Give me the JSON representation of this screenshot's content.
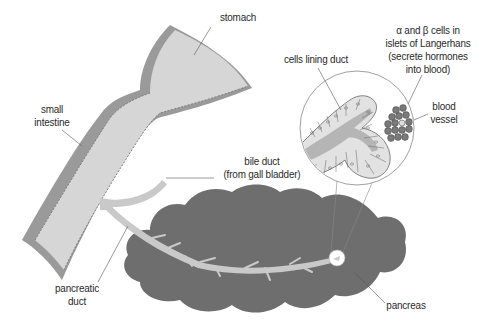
{
  "diagram": {
    "colors": {
      "background": "#ffffff",
      "intestine_wall": "#9a9a9a",
      "intestine_lumen": "#d6d6d6",
      "pancreas": "#6e6e6e",
      "duct": "#c9c9c9",
      "cells": "#e2e2e2",
      "islet_cells": "#7a7a7a",
      "leader_line": "#555555",
      "text": "#2a2a2a"
    },
    "labels": {
      "stomach": "stomach",
      "small_intestine": [
        "small",
        "intestine"
      ],
      "bile_duct": [
        "bile duct",
        "(from gall bladder)"
      ],
      "pancreatic_duct": [
        "pancreatic",
        "duct"
      ],
      "pancreas": "pancreas",
      "cells_lining_duct": "cells lining duct",
      "islets": [
        "α and β cells in",
        "islets of Langerhans",
        "(secrete hormones",
        "into blood)"
      ],
      "blood_vessel": [
        "blood",
        "vessel"
      ]
    }
  }
}
